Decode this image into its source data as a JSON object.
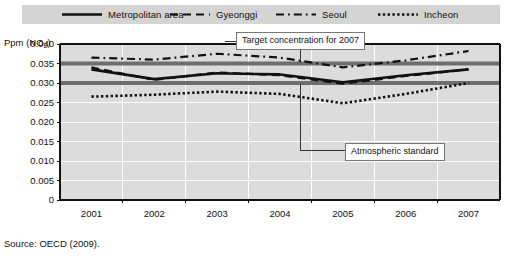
{
  "legend": {
    "entries": [
      {
        "label": "Metropolitan area",
        "style": "solid",
        "key": "legend-key-metropolitan"
      },
      {
        "label": "Gyeonggi",
        "style": "dashed",
        "key": "legend-key-gyeonggi"
      },
      {
        "label": "Seoul",
        "style": "dashdot",
        "key": "legend-key-seoul"
      },
      {
        "label": "Incheon",
        "style": "dotted",
        "key": "legend-key-incheon"
      }
    ]
  },
  "axis": {
    "y_title_main": "Ppm  (NO",
    "y_title_sub": "2",
    "y_title_close": ")",
    "y_ticks": [
      "0.040",
      "0.035",
      "0.030",
      "0.025",
      "0.020",
      "0.015",
      "0.010",
      "0.005",
      "0"
    ],
    "x_ticks": [
      "2001",
      "2002",
      "2003",
      "2004",
      "2005",
      "2006",
      "2007"
    ]
  },
  "annotations": {
    "target": "Target concentration for 2007",
    "standard": "Atmospheric standard"
  },
  "source": "Source:  OECD (2009).",
  "colors": {
    "plot_background": "#dcdcdc",
    "gridline": "#ffffff",
    "legend_background": "#d4d4d4",
    "series_line": "#111111",
    "reference_band": "#6e6e6e",
    "axis": "#111111"
  },
  "chart_data": {
    "type": "line",
    "title": "",
    "xlabel": "",
    "ylabel": "Ppm (NO2)",
    "x": [
      2001,
      2002,
      2003,
      2004,
      2005,
      2006,
      2007
    ],
    "ylim": [
      0,
      0.04
    ],
    "ytick_step": 0.005,
    "grid": true,
    "legend_position": "top",
    "series": [
      {
        "name": "Metropolitan area",
        "style": "solid",
        "values": [
          0.0335,
          0.031,
          0.0325,
          0.0322,
          0.0302,
          0.032,
          0.0335
        ]
      },
      {
        "name": "Gyeonggi",
        "style": "dashed",
        "values": [
          0.034,
          0.0308,
          0.0327,
          0.032,
          0.0298,
          0.0318,
          0.0335
        ]
      },
      {
        "name": "Seoul",
        "style": "dashdot",
        "values": [
          0.0365,
          0.036,
          0.0375,
          0.0365,
          0.034,
          0.0358,
          0.0382
        ]
      },
      {
        "name": "Incheon",
        "style": "dotted",
        "values": [
          0.0265,
          0.027,
          0.0278,
          0.0272,
          0.0248,
          0.0272,
          0.03
        ]
      }
    ],
    "reference_lines": [
      {
        "name": "Target concentration for 2007",
        "value": 0.035
      },
      {
        "name": "Atmospheric standard",
        "value": 0.03
      }
    ]
  }
}
